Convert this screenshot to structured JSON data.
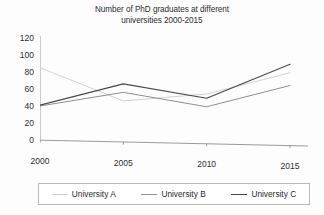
{
  "chart_data": {
    "type": "line",
    "title": "Number of PhD graduates at different universities 2000-2015",
    "title_line1": "Number of PhD graduates at different",
    "title_line2": "universities 2000-2015",
    "xlabel": "",
    "ylabel": "",
    "categories": [
      "2000",
      "2005",
      "2010",
      "2015"
    ],
    "x": [
      2000,
      2005,
      2010,
      2015
    ],
    "series": [
      {
        "name": "University A",
        "values": [
          85,
          48,
          58,
          85
        ],
        "color": "#d2d2d2"
      },
      {
        "name": "University B",
        "values": [
          40,
          58,
          43,
          70
        ],
        "color": "#8f8f8f"
      },
      {
        "name": "University C",
        "values": [
          41,
          68,
          53,
          95
        ],
        "color": "#4a4a4a"
      }
    ],
    "ylim": [
      0,
      120
    ],
    "yticks": [
      "0",
      "20",
      "40",
      "60",
      "80",
      "100",
      "120"
    ],
    "ytick_values": [
      0,
      20,
      40,
      60,
      80,
      100,
      120
    ],
    "xlim": [
      2000,
      2015
    ],
    "grid": false,
    "legend_position": "bottom",
    "axis_color": "#9a9a9a"
  },
  "legend": {
    "entries": [
      {
        "label": "University A"
      },
      {
        "label": "University B"
      },
      {
        "label": "University C"
      }
    ]
  }
}
